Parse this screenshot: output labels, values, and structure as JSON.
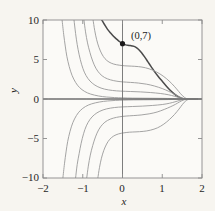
{
  "chart_data": {
    "type": "line",
    "title": "",
    "subtitle": "",
    "xlabel": "x",
    "ylabel": "y",
    "xlim": [
      -2,
      2
    ],
    "ylim": [
      -10,
      10
    ],
    "xticks": [
      -2,
      -1,
      0,
      1,
      2
    ],
    "xticklabels": [
      "−2",
      "−1",
      "0",
      "1",
      "2"
    ],
    "yticks": [
      -10,
      -5,
      0,
      5,
      10
    ],
    "yticklabels": [
      "−10",
      "−5",
      "0",
      "5",
      "10"
    ],
    "grid": false,
    "legend": "none",
    "axis_lines": {
      "x_axis_at_y": 0,
      "y_axis_at_x": 0,
      "frame": true
    },
    "annotations": [
      {
        "label": "(0,7)",
        "x": 0,
        "y": 7,
        "marker": "filled-circle",
        "marker_color": "#1a1a1a",
        "label_offset": [
          0.22,
          1.1
        ]
      }
    ],
    "convergence_node": {
      "x": 1.55,
      "y": 0
    },
    "series": [
      {
        "name": "highlighted-solution-through-0-7",
        "highlighted": true,
        "color": "#4a4a4a",
        "width": 1.5,
        "points": [
          [
            -0.52,
            10.0
          ],
          [
            -0.45,
            9.4
          ],
          [
            -0.38,
            8.85
          ],
          [
            -0.3,
            8.35
          ],
          [
            -0.22,
            7.9
          ],
          [
            -0.14,
            7.55
          ],
          [
            -0.07,
            7.25
          ],
          [
            0.0,
            7.0
          ],
          [
            0.08,
            6.85
          ],
          [
            0.16,
            6.78
          ],
          [
            0.24,
            6.72
          ],
          [
            0.32,
            6.6
          ],
          [
            0.4,
            6.3
          ],
          [
            0.48,
            5.85
          ],
          [
            0.56,
            5.3
          ],
          [
            0.64,
            4.7
          ],
          [
            0.72,
            4.1
          ],
          [
            0.8,
            3.5
          ],
          [
            0.9,
            2.85
          ],
          [
            1.0,
            2.25
          ],
          [
            1.1,
            1.65
          ],
          [
            1.2,
            1.1
          ],
          [
            1.3,
            0.65
          ],
          [
            1.4,
            0.3
          ],
          [
            1.5,
            0.08
          ],
          [
            1.6,
            0.0
          ],
          [
            1.75,
            0.0
          ],
          [
            2.0,
            0.0
          ]
        ]
      },
      {
        "name": "upper-solution-a",
        "highlighted": false,
        "color": "#9a9a9a",
        "width": 0.9,
        "points": [
          [
            -1.52,
            10.0
          ],
          [
            -1.48,
            8.2
          ],
          [
            -1.44,
            6.7
          ],
          [
            -1.4,
            5.4
          ],
          [
            -1.34,
            4.1
          ],
          [
            -1.27,
            3.0
          ],
          [
            -1.18,
            2.1
          ],
          [
            -1.08,
            1.45
          ],
          [
            -0.95,
            0.95
          ],
          [
            -0.8,
            0.62
          ],
          [
            -0.6,
            0.38
          ],
          [
            -0.4,
            0.25
          ],
          [
            -0.2,
            0.18
          ],
          [
            0.0,
            0.14
          ],
          [
            0.25,
            0.11
          ],
          [
            0.5,
            0.1
          ],
          [
            0.75,
            0.09
          ],
          [
            1.0,
            0.08
          ],
          [
            1.25,
            0.06
          ],
          [
            1.45,
            0.03
          ],
          [
            1.6,
            0.0
          ],
          [
            2.0,
            0.0
          ]
        ]
      },
      {
        "name": "upper-solution-b",
        "highlighted": false,
        "color": "#9a9a9a",
        "width": 0.9,
        "points": [
          [
            -1.22,
            10.0
          ],
          [
            -1.18,
            8.3
          ],
          [
            -1.14,
            6.9
          ],
          [
            -1.09,
            5.6
          ],
          [
            -1.03,
            4.4
          ],
          [
            -0.96,
            3.4
          ],
          [
            -0.87,
            2.6
          ],
          [
            -0.76,
            2.0
          ],
          [
            -0.62,
            1.55
          ],
          [
            -0.45,
            1.25
          ],
          [
            -0.25,
            1.08
          ],
          [
            -0.05,
            1.0
          ],
          [
            0.2,
            0.95
          ],
          [
            0.45,
            0.9
          ],
          [
            0.7,
            0.82
          ],
          [
            0.95,
            0.7
          ],
          [
            1.15,
            0.54
          ],
          [
            1.3,
            0.36
          ],
          [
            1.42,
            0.18
          ],
          [
            1.55,
            0.02
          ],
          [
            1.7,
            0.0
          ],
          [
            2.0,
            0.0
          ]
        ]
      },
      {
        "name": "upper-solution-c",
        "highlighted": false,
        "color": "#9a9a9a",
        "width": 0.9,
        "points": [
          [
            -0.97,
            10.0
          ],
          [
            -0.93,
            8.5
          ],
          [
            -0.88,
            7.1
          ],
          [
            -0.82,
            5.9
          ],
          [
            -0.75,
            4.8
          ],
          [
            -0.67,
            3.9
          ],
          [
            -0.57,
            3.2
          ],
          [
            -0.45,
            2.72
          ],
          [
            -0.3,
            2.42
          ],
          [
            -0.14,
            2.25
          ],
          [
            0.02,
            2.16
          ],
          [
            0.2,
            2.1
          ],
          [
            0.4,
            2.02
          ],
          [
            0.6,
            1.88
          ],
          [
            0.8,
            1.65
          ],
          [
            1.0,
            1.32
          ],
          [
            1.15,
            1.0
          ],
          [
            1.28,
            0.68
          ],
          [
            1.4,
            0.36
          ],
          [
            1.52,
            0.1
          ],
          [
            1.65,
            0.0
          ],
          [
            2.0,
            0.0
          ]
        ]
      },
      {
        "name": "upper-solution-d",
        "highlighted": false,
        "color": "#9a9a9a",
        "width": 0.9,
        "points": [
          [
            -0.74,
            10.0
          ],
          [
            -0.7,
            8.7
          ],
          [
            -0.65,
            7.5
          ],
          [
            -0.59,
            6.5
          ],
          [
            -0.52,
            5.7
          ],
          [
            -0.44,
            5.1
          ],
          [
            -0.34,
            4.68
          ],
          [
            -0.22,
            4.42
          ],
          [
            -0.08,
            4.28
          ],
          [
            0.06,
            4.2
          ],
          [
            0.22,
            4.16
          ],
          [
            0.4,
            4.1
          ],
          [
            0.58,
            3.95
          ],
          [
            0.76,
            3.65
          ],
          [
            0.94,
            3.18
          ],
          [
            1.1,
            2.6
          ],
          [
            1.24,
            1.95
          ],
          [
            1.36,
            1.28
          ],
          [
            1.46,
            0.68
          ],
          [
            1.56,
            0.2
          ],
          [
            1.68,
            0.0
          ],
          [
            2.0,
            0.0
          ]
        ]
      },
      {
        "name": "lower-solution-a",
        "highlighted": false,
        "color": "#9a9a9a",
        "width": 0.9,
        "points": [
          [
            -1.5,
            -10.0
          ],
          [
            -1.46,
            -8.2
          ],
          [
            -1.42,
            -6.7
          ],
          [
            -1.38,
            -5.4
          ],
          [
            -1.32,
            -4.1
          ],
          [
            -1.25,
            -3.0
          ],
          [
            -1.16,
            -2.1
          ],
          [
            -1.06,
            -1.45
          ],
          [
            -0.93,
            -0.95
          ],
          [
            -0.78,
            -0.62
          ],
          [
            -0.58,
            -0.38
          ],
          [
            -0.38,
            -0.25
          ],
          [
            -0.18,
            -0.18
          ],
          [
            0.02,
            -0.14
          ],
          [
            0.27,
            -0.11
          ],
          [
            0.52,
            -0.1
          ],
          [
            0.77,
            -0.09
          ],
          [
            1.02,
            -0.08
          ],
          [
            1.27,
            -0.06
          ],
          [
            1.45,
            -0.03
          ],
          [
            1.6,
            0.0
          ],
          [
            2.0,
            0.0
          ]
        ]
      },
      {
        "name": "lower-solution-b",
        "highlighted": false,
        "color": "#9a9a9a",
        "width": 0.9,
        "points": [
          [
            -1.18,
            -10.0
          ],
          [
            -1.14,
            -8.3
          ],
          [
            -1.09,
            -6.9
          ],
          [
            -1.04,
            -5.6
          ],
          [
            -0.98,
            -4.4
          ],
          [
            -0.91,
            -3.4
          ],
          [
            -0.82,
            -2.6
          ],
          [
            -0.71,
            -2.0
          ],
          [
            -0.57,
            -1.55
          ],
          [
            -0.4,
            -1.25
          ],
          [
            -0.2,
            -1.08
          ],
          [
            0.0,
            -1.0
          ],
          [
            0.25,
            -0.95
          ],
          [
            0.5,
            -0.9
          ],
          [
            0.75,
            -0.82
          ],
          [
            1.0,
            -0.7
          ],
          [
            1.18,
            -0.54
          ],
          [
            1.32,
            -0.36
          ],
          [
            1.44,
            -0.18
          ],
          [
            1.56,
            -0.02
          ],
          [
            1.7,
            0.0
          ],
          [
            2.0,
            0.0
          ]
        ]
      },
      {
        "name": "lower-solution-c",
        "highlighted": false,
        "color": "#9a9a9a",
        "width": 0.9,
        "points": [
          [
            -0.9,
            -10.0
          ],
          [
            -0.86,
            -8.5
          ],
          [
            -0.81,
            -7.1
          ],
          [
            -0.75,
            -5.9
          ],
          [
            -0.68,
            -4.8
          ],
          [
            -0.6,
            -3.9
          ],
          [
            -0.5,
            -3.2
          ],
          [
            -0.38,
            -2.72
          ],
          [
            -0.23,
            -2.42
          ],
          [
            -0.07,
            -2.25
          ],
          [
            0.09,
            -2.16
          ],
          [
            0.27,
            -2.1
          ],
          [
            0.47,
            -2.02
          ],
          [
            0.67,
            -1.88
          ],
          [
            0.87,
            -1.65
          ],
          [
            1.05,
            -1.32
          ],
          [
            1.2,
            -1.0
          ],
          [
            1.33,
            -0.68
          ],
          [
            1.44,
            -0.36
          ],
          [
            1.55,
            -0.1
          ],
          [
            1.68,
            0.0
          ],
          [
            2.0,
            0.0
          ]
        ]
      },
      {
        "name": "lower-solution-d",
        "highlighted": false,
        "color": "#9a9a9a",
        "width": 0.9,
        "points": [
          [
            -0.62,
            -10.0
          ],
          [
            -0.58,
            -8.7
          ],
          [
            -0.53,
            -7.5
          ],
          [
            -0.47,
            -6.5
          ],
          [
            -0.4,
            -5.7
          ],
          [
            -0.32,
            -5.1
          ],
          [
            -0.22,
            -4.68
          ],
          [
            -0.1,
            -4.42
          ],
          [
            0.04,
            -4.28
          ],
          [
            0.18,
            -4.2
          ],
          [
            0.34,
            -4.16
          ],
          [
            0.52,
            -4.1
          ],
          [
            0.7,
            -3.95
          ],
          [
            0.88,
            -3.65
          ],
          [
            1.04,
            -3.18
          ],
          [
            1.18,
            -2.6
          ],
          [
            1.31,
            -1.95
          ],
          [
            1.42,
            -1.28
          ],
          [
            1.51,
            -0.68
          ],
          [
            1.6,
            -0.2
          ],
          [
            1.72,
            0.0
          ],
          [
            2.0,
            0.0
          ]
        ]
      },
      {
        "name": "equilibrium-zero-line-left",
        "highlighted": false,
        "color": "#6e6e6e",
        "width": 1.0,
        "points": [
          [
            -2.0,
            0.0
          ],
          [
            2.0,
            0.0
          ]
        ]
      }
    ],
    "colors": {
      "background": "#f7f5f0",
      "frame": "#8a8a8a",
      "axis": "#6e6e6e",
      "curve": "#9a9a9a",
      "highlight_curve": "#4a4a4a",
      "marker": "#1a1a1a",
      "text": "#262626"
    }
  },
  "geometry": {
    "plot_left_px": 43,
    "plot_right_px": 202,
    "plot_top_px": 20,
    "plot_bottom_px": 178
  }
}
